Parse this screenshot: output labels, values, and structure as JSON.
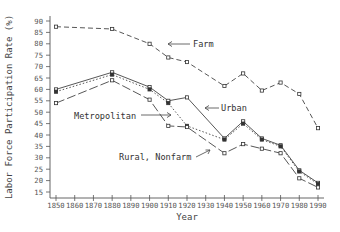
{
  "chart_data": {
    "type": "line",
    "title": "",
    "xlabel": "Year",
    "ylabel": "Labor Force Participation Rate (%)",
    "xlim": [
      1850,
      1990
    ],
    "ylim": [
      15,
      90
    ],
    "x_ticks": [
      "1850",
      "1860",
      "1870",
      "1880",
      "1890",
      "1900",
      "1910",
      "1920",
      "1930",
      "1940",
      "1950",
      "1960",
      "1970",
      "1980",
      "1990"
    ],
    "y_ticks": [
      "15",
      "20",
      "25",
      "30",
      "35",
      "40",
      "45",
      "50",
      "55",
      "60",
      "65",
      "70",
      "75",
      "80",
      "85",
      "90"
    ],
    "grid": false,
    "legend": "none (inline annotations)",
    "series": [
      {
        "name": "Farm",
        "style": "dashed",
        "x": [
          1850,
          1880,
          1900,
          1910,
          1920,
          1940,
          1950,
          1960,
          1970,
          1980,
          1990
        ],
        "values": [
          87.5,
          86.5,
          80,
          74,
          72,
          61.5,
          67,
          59.5,
          63,
          58,
          43
        ]
      },
      {
        "name": "Urban",
        "style": "solid",
        "x": [
          1850,
          1880,
          1900,
          1910,
          1920,
          1940,
          1950,
          1960,
          1970,
          1980,
          1990
        ],
        "values": [
          60,
          67.5,
          61,
          55,
          56.5,
          38.5,
          46,
          38.5,
          35.5,
          24.5,
          19
        ]
      },
      {
        "name": "Metropolitan",
        "style": "dotted",
        "x": [
          1850,
          1880,
          1900,
          1910,
          1920,
          1940,
          1950,
          1960,
          1970,
          1980,
          1990
        ],
        "values": [
          59,
          66.5,
          60,
          54,
          44,
          38,
          45,
          38,
          35,
          24,
          18.5
        ]
      },
      {
        "name": "Rural, Nonfarm",
        "style": "long-dash",
        "x": [
          1850,
          1880,
          1900,
          1910,
          1920,
          1940,
          1950,
          1960,
          1970,
          1980,
          1990
        ],
        "values": [
          54,
          64,
          55.5,
          44,
          43.5,
          32,
          36,
          34,
          32,
          21,
          17
        ]
      }
    ],
    "annotations": [
      {
        "text": "Farm",
        "points_to": "Farm",
        "arrow": "left"
      },
      {
        "text": "Urban",
        "points_to": "Urban",
        "arrow": "left"
      },
      {
        "text": "Metropolitan",
        "points_to": "Metropolitan",
        "arrow": "right"
      },
      {
        "text": "Rural, Nonfarm",
        "points_to": "Rural, Nonfarm",
        "arrow": "right"
      }
    ]
  }
}
